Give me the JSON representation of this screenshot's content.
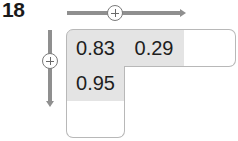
{
  "problem": {
    "number": "18"
  },
  "operations": {
    "horizontal": {
      "symbol": "+",
      "icon": "circle-plus-icon",
      "direction": "right"
    },
    "vertical": {
      "symbol": "+",
      "icon": "circle-plus-icon",
      "direction": "down"
    }
  },
  "grid": {
    "top_row": [
      {
        "value": "0.83",
        "filled": true
      },
      {
        "value": "0.29",
        "filled": true
      },
      {
        "value": "",
        "filled": false
      }
    ],
    "left_column": [
      {
        "value": "0.83",
        "filled": true
      },
      {
        "value": "0.95",
        "filled": true
      },
      {
        "value": "",
        "filled": false
      }
    ]
  },
  "colors": {
    "arrow": "#8f8f8f",
    "filled_cell": "#e4e4e4",
    "empty_cell": "#ffffff",
    "border": "#b8b8b8",
    "text": "#1e1e1e"
  }
}
